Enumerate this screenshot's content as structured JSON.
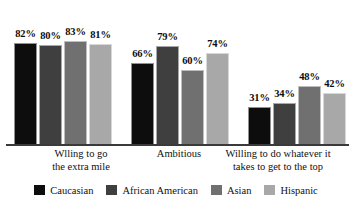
{
  "chart_data": {
    "type": "bar",
    "title": "",
    "subtitle": "",
    "xlabel": "",
    "ylabel": "",
    "ylim": [
      0,
      100
    ],
    "grid": false,
    "legend_position": "bottom",
    "value_suffix": "%",
    "categories": [
      "Wlling to go the extra mile",
      "Ambitious",
      "Willing to do whatever it takes to get to the top"
    ],
    "category_lines": [
      [
        "Wlling to go",
        "the extra mile"
      ],
      [
        "Ambitious",
        ""
      ],
      [
        "Willing to do whatever it",
        "takes to get to the top"
      ]
    ],
    "series": [
      {
        "name": "Caucasian",
        "color": "#0d0d0d",
        "values": [
          82,
          66,
          31
        ],
        "labels": [
          "82%",
          "66%",
          "31%"
        ]
      },
      {
        "name": "African American",
        "color": "#3f3f3f",
        "values": [
          80,
          79,
          34
        ],
        "labels": [
          "80%",
          "79%",
          "34%"
        ]
      },
      {
        "name": "Asian",
        "color": "#707070",
        "values": [
          83,
          60,
          48
        ],
        "labels": [
          "83%",
          "60%",
          "48%"
        ]
      },
      {
        "name": "Hispanic",
        "color": "#a8a8a8",
        "values": [
          81,
          74,
          42
        ],
        "labels": [
          "81%",
          "74%",
          "42%"
        ]
      }
    ]
  },
  "axis": {
    "baseline_color": "#3a3a3a"
  }
}
